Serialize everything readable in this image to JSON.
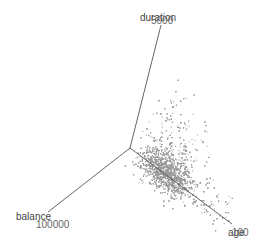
{
  "chart_data": {
    "type": "scatter",
    "subtype": "3d-scatter",
    "title": "",
    "axes": [
      {
        "name": "duration",
        "label": "duration",
        "max_tick_label": "5000",
        "direction": "up"
      },
      {
        "name": "balance",
        "label": "balance",
        "max_tick_label": "100000",
        "direction": "down-left"
      },
      {
        "name": "age",
        "label": "age",
        "max_tick_label": "100",
        "direction": "down-right"
      }
    ],
    "grid": false,
    "legend": null,
    "point_color": "#9a9a9a",
    "point_count_estimate": 3000
  },
  "labels": {
    "duration": "duration",
    "duration_tick": "5000",
    "balance": "balance",
    "balance_tick": "100000",
    "age": "age",
    "age_tick": "100"
  },
  "geometry": {
    "origin": [
      130,
      148
    ],
    "duration_end": [
      161,
      25
    ],
    "balance_end": [
      48,
      212
    ],
    "age_end": [
      232,
      224
    ]
  }
}
